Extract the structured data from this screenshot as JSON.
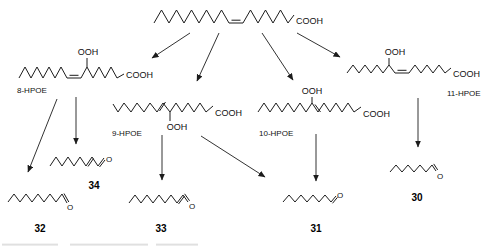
{
  "diagram": {
    "substrate": {
      "cooh_label": "COOH"
    },
    "hydroperoxides": [
      {
        "name": "8-HPOE",
        "ooh_label": "OOH",
        "cooh_label": "COOH"
      },
      {
        "name": "9-HPOE",
        "ooh_label": "OOH",
        "cooh_label": "COOH"
      },
      {
        "name": "10-HPOE",
        "ooh_label": "OOH",
        "cooh_label": "COOH"
      },
      {
        "name": "11-HPOE",
        "ooh_label": "OOH",
        "cooh_label": "COOH"
      }
    ],
    "aldehydes": [
      {
        "number": "30",
        "o_label": "O"
      },
      {
        "number": "31",
        "o_label": "O"
      },
      {
        "number": "32",
        "o_label": "O"
      },
      {
        "number": "33",
        "o_label": "O"
      },
      {
        "number": "34",
        "o_label": "O"
      }
    ],
    "colors": {
      "line": "#1c1c1c",
      "background": "#ffffff"
    }
  }
}
